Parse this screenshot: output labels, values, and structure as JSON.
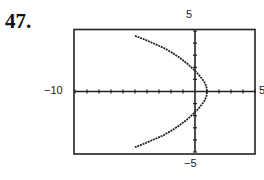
{
  "problem": {
    "number": "47."
  },
  "labels": {
    "y_max": "5",
    "y_min": "−5",
    "x_min": "−10",
    "x_max": "5"
  },
  "chart_data": {
    "type": "line",
    "title": "",
    "xlabel": "",
    "ylabel": "",
    "xlim": [
      -10,
      5
    ],
    "ylim": [
      -5,
      5
    ],
    "grid": false,
    "x_tick_step": 1,
    "y_tick_step": 1,
    "legend": null,
    "series": [
      {
        "name": "curve",
        "x": [
          -5.0,
          -4.2,
          -3.4,
          -2.6,
          -1.9,
          -1.3,
          -0.7,
          -0.2,
          0.2,
          0.55,
          0.8,
          0.95,
          1.0,
          0.95,
          0.8,
          0.55,
          0.2,
          -0.2,
          -0.7,
          -1.3,
          -1.9,
          -2.6,
          -3.4,
          -4.2,
          -5.0
        ],
        "y": [
          4.6,
          4.3,
          3.95,
          3.6,
          3.2,
          2.8,
          2.35,
          1.9,
          1.5,
          1.1,
          0.75,
          0.4,
          0.0,
          -0.4,
          -0.75,
          -1.1,
          -1.5,
          -1.9,
          -2.35,
          -2.8,
          -3.2,
          -3.6,
          -3.95,
          -4.3,
          -4.6
        ]
      }
    ]
  }
}
